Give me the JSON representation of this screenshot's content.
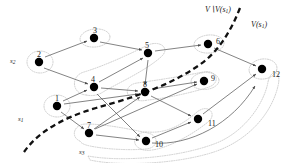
{
  "figure": {
    "kind": "directed-graph-diagram",
    "width": 303,
    "height": 163,
    "background": "#ffffff",
    "node_color": "#000000",
    "edge_color": "#555555",
    "hull_color": "#b8b8b8",
    "separator_color": "#111111"
  },
  "nodes": [
    {
      "id": "1",
      "label": "1",
      "x": 57,
      "y": 106,
      "label_dx": 0,
      "label_dy": -11
    },
    {
      "id": "2",
      "label": "2",
      "x": 39,
      "y": 62,
      "label_dx": 0,
      "label_dy": -11
    },
    {
      "id": "3",
      "label": "3",
      "x": 94,
      "y": 38,
      "label_dx": 1,
      "label_dy": -11
    },
    {
      "id": "4",
      "label": "4",
      "x": 94,
      "y": 87,
      "label_dx": -1,
      "label_dy": -11
    },
    {
      "id": "5",
      "label": "5",
      "x": 148,
      "y": 53,
      "label_dx": -1,
      "label_dy": -11
    },
    {
      "id": "6",
      "label": "6",
      "x": 208,
      "y": 44,
      "label_dx": 9,
      "label_dy": -5
    },
    {
      "id": "7",
      "label": "7",
      "x": 89,
      "y": 133,
      "label_dx": 0,
      "label_dy": -11
    },
    {
      "id": "8",
      "label": "8",
      "x": 145,
      "y": 92,
      "label_dx": -1,
      "label_dy": -11
    },
    {
      "id": "9",
      "label": "9",
      "x": 204,
      "y": 81,
      "label_dx": 8,
      "label_dy": -5
    },
    {
      "id": "10",
      "label": "10",
      "x": 146,
      "y": 141,
      "label_dx": 10,
      "label_dy": 1
    },
    {
      "id": "11",
      "label": "11",
      "x": 198,
      "y": 119,
      "label_dx": 11,
      "label_dy": 2
    },
    {
      "id": "12",
      "label": "12",
      "x": 262,
      "y": 69,
      "label_dx": 11,
      "label_dy": 3
    }
  ],
  "source_labels": [
    {
      "id": "s2",
      "text": "s",
      "subscript": "2",
      "x": 14,
      "y": 62
    },
    {
      "id": "s1",
      "text": "s",
      "subscript": "1",
      "x": 22,
      "y": 120
    },
    {
      "id": "s3",
      "text": "s",
      "subscript": "3",
      "x": 83,
      "y": 152
    }
  ],
  "region_labels": [
    {
      "id": "outside",
      "prefix": "V",
      "setminus": "∖",
      "suffix": "V(s",
      "subscript": "1",
      "close": ")",
      "x": 208,
      "y": 11
    },
    {
      "id": "inside",
      "prefix": "",
      "setminus": "",
      "suffix": "V(s",
      "subscript": "1",
      "close": ")",
      "x": 254,
      "y": 26
    }
  ],
  "edges": [
    {
      "from": "2",
      "to": "3"
    },
    {
      "from": "2",
      "to": "4"
    },
    {
      "from": "3",
      "to": "5"
    },
    {
      "from": "4",
      "to": "5"
    },
    {
      "from": "5",
      "to": "6"
    },
    {
      "from": "5",
      "to": "8"
    },
    {
      "from": "6",
      "to": "12"
    },
    {
      "from": "1",
      "to": "4"
    },
    {
      "from": "1",
      "to": "7"
    },
    {
      "from": "1",
      "to": "8"
    },
    {
      "from": "4",
      "to": "8"
    },
    {
      "from": "4",
      "to": "10"
    },
    {
      "from": "7",
      "to": "8"
    },
    {
      "from": "7",
      "to": "9"
    },
    {
      "from": "7",
      "to": "10"
    },
    {
      "from": "8",
      "to": "9"
    },
    {
      "from": "8",
      "to": "11"
    },
    {
      "from": "10",
      "to": "11"
    },
    {
      "from": "11",
      "to": "12"
    },
    {
      "from": "10",
      "to": "12"
    }
  ],
  "hulls": [
    {
      "id": "hull-s2",
      "nodes": [
        "2"
      ]
    },
    {
      "id": "hull-s1",
      "nodes": [
        "1"
      ]
    },
    {
      "id": "hull-3",
      "nodes": [
        "3"
      ]
    },
    {
      "id": "hull-6",
      "nodes": [
        "6"
      ]
    },
    {
      "id": "hull-9",
      "nodes": [
        "9"
      ]
    },
    {
      "id": "hull-12",
      "nodes": [
        "12"
      ]
    },
    {
      "id": "hull-4-5",
      "nodes": [
        "4",
        "5"
      ]
    },
    {
      "id": "hull-8-9",
      "nodes": [
        "8",
        "9"
      ]
    },
    {
      "id": "hull-s3",
      "nodes": [
        "7",
        "10"
      ]
    },
    {
      "id": "hull-11",
      "nodes": [
        "10",
        "11"
      ]
    },
    {
      "id": "hull-outer",
      "nodes": [
        "7",
        "10",
        "11",
        "12"
      ]
    }
  ]
}
